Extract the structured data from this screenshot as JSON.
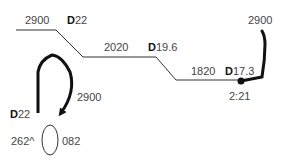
{
  "diagram": {
    "segments": [
      {
        "distance": "2900",
        "heading_prefix": "D",
        "heading": "22"
      },
      {
        "distance": "2020",
        "heading_prefix": "D",
        "heading": "19.6"
      },
      {
        "distance": "1820",
        "heading_prefix": "D",
        "heading": "17.3"
      }
    ],
    "final_turn": {
      "distance": "2900",
      "time": "2:21"
    },
    "hold": {
      "entry_distance": "2900",
      "heading_prefix": "D",
      "heading": "22",
      "inbound": "262^",
      "outbound": "082"
    },
    "colors": {
      "thin_line": "#333333",
      "thick_line": "#111111",
      "text": "#444444"
    }
  }
}
